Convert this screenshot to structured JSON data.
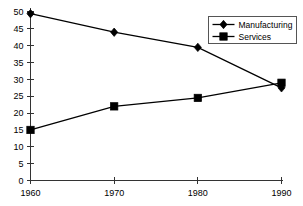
{
  "chart_data": {
    "type": "line",
    "title": "",
    "subtitle": "",
    "xlabel": "",
    "ylabel": "",
    "categories": [
      "1960",
      "1970",
      "1980",
      "1990"
    ],
    "x": [
      1960,
      1970,
      1980,
      1990
    ],
    "xlim": [
      1960,
      1990
    ],
    "ylim": [
      0,
      50
    ],
    "grid": false,
    "legend_position": "top-right",
    "y_ticks": [
      0,
      5,
      10,
      15,
      20,
      25,
      30,
      35,
      40,
      45,
      50
    ],
    "y_tick_labels": [
      "0",
      "5",
      "10",
      "15",
      "20",
      "25",
      "30",
      "35",
      "40",
      "45",
      "50"
    ],
    "x_tick_labels": [
      "1960",
      "1970",
      "1980",
      "1990"
    ],
    "series": [
      {
        "name": "Manufacturing",
        "marker": "diamond",
        "color": "#000000",
        "values": [
          49.5,
          44,
          39.5,
          27.5
        ]
      },
      {
        "name": "Services",
        "marker": "square",
        "color": "#000000",
        "values": [
          15,
          22,
          24.5,
          29
        ]
      }
    ]
  },
  "legend": {
    "entries": [
      {
        "label": "Manufacturing",
        "marker": "diamond-marker-icon"
      },
      {
        "label": "Services",
        "marker": "square-marker-icon"
      }
    ]
  },
  "colors": {
    "background": "#ffffff",
    "axis": "#333333",
    "series": "#000000",
    "legend_border": "#555555"
  }
}
